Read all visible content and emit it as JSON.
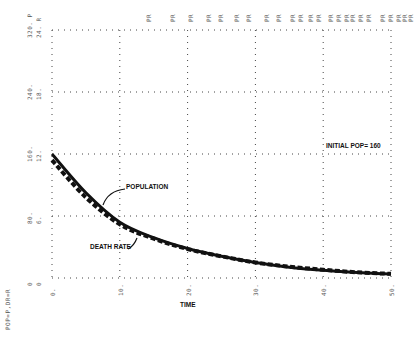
{
  "chart_data": {
    "type": "line",
    "title": "",
    "xlabel": "TIME",
    "ylabel": "POP=P,DR=R",
    "xlim": [
      0,
      50
    ],
    "ylim_population": [
      0,
      320
    ],
    "ylim_death_rate": [
      0,
      24
    ],
    "grid": true,
    "x_ticks": [
      "0.",
      "10.",
      "20.",
      "30.",
      "40.",
      "50."
    ],
    "y_ticks": [
      {
        "p": "0",
        "r": "0"
      },
      {
        "p": "80.",
        "r": "6."
      },
      {
        "p": "160.",
        "r": "12."
      },
      {
        "p": "240.",
        "r": "18."
      },
      {
        "p": "320. P",
        "r": "24. R"
      }
    ],
    "top_markers": [
      "PR",
      "PR",
      "PR",
      "PR",
      "PR",
      "PR",
      "PR",
      "PR",
      "PR",
      "PR",
      "PR",
      "PR",
      "PR",
      "PR",
      "PR",
      "PR",
      "PR",
      "PR",
      "PR",
      "PR",
      "PR",
      "PR",
      "PR",
      "PR"
    ],
    "x": [
      0,
      5,
      10,
      15,
      20,
      25,
      30,
      35,
      40,
      45,
      50
    ],
    "series": [
      {
        "name": "POPULATION",
        "style": "solid",
        "scale": "P",
        "values": [
          160,
          110,
          72,
          52,
          38,
          28,
          20,
          14,
          10,
          7,
          5
        ]
      },
      {
        "name": "DEATH RATE",
        "style": "dashed",
        "scale": "R",
        "values": [
          11.4,
          7.8,
          5.2,
          3.8,
          2.8,
          2.1,
          1.5,
          1.1,
          0.8,
          0.55,
          0.4
        ]
      }
    ],
    "annotations": [
      {
        "text": "POPULATION",
        "x": 10.5,
        "y": 110
      },
      {
        "text": "DEATH RATE",
        "x": 8,
        "y": 52
      },
      {
        "text": "INITIAL POP= 160",
        "x": 42,
        "y": 160
      }
    ]
  }
}
